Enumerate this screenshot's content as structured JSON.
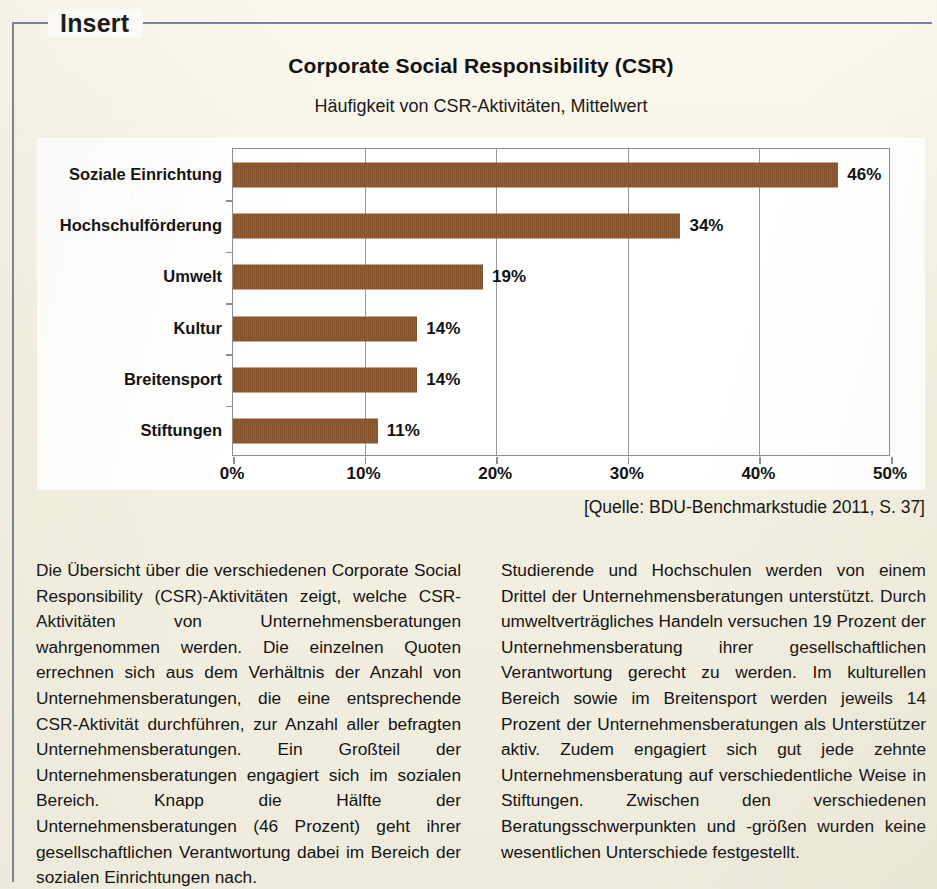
{
  "frame": {
    "legend_label": "Insert",
    "border_color": "#7a7f9f"
  },
  "chart_header": {
    "title": "Corporate Social Responsibility (CSR)",
    "subtitle": "Häufigkeit von CSR-Aktivitäten, Mittelwert"
  },
  "source": {
    "text": "[Quelle: BDU-Benchmarkstudie 2011, S. 37]"
  },
  "chart_data": {
    "type": "bar",
    "orientation": "horizontal",
    "title": "Corporate Social Responsibility (CSR)",
    "subtitle": "Häufigkeit von CSR-Aktivitäten, Mittelwert",
    "xlabel": "",
    "ylabel": "",
    "xlim": [
      0,
      50
    ],
    "grid": true,
    "legend": false,
    "bar_color": "#8a5429",
    "categories": [
      "Soziale Einrichtung",
      "Hochschulförderung",
      "Umwelt",
      "Kultur",
      "Breitensport",
      "Stiftungen"
    ],
    "values": [
      46,
      34,
      19,
      14,
      14,
      11
    ],
    "value_labels": [
      "46%",
      "34%",
      "19%",
      "14%",
      "14%",
      "11%"
    ],
    "xticks": [
      0,
      10,
      20,
      30,
      40,
      50
    ],
    "xtick_labels": [
      "0%",
      "10%",
      "20%",
      "30%",
      "40%",
      "50%"
    ]
  },
  "body": {
    "left_column": "Die Übersicht über die verschiedenen Corporate Social Responsibility (CSR)-Aktivitäten zeigt, welche CSR-Aktivitäten von Unternehmensberatungen wahrgenommen werden. Die einzelnen Quoten errechnen sich aus dem Verhältnis der Anzahl von Unternehmensberatungen, die eine entsprechende CSR-Aktivität durchführen, zur Anzahl aller befragten Unternehmensberatungen. Ein Großteil der Unternehmensberatungen engagiert sich im sozialen Bereich. Knapp die Hälfte der Unternehmensberatungen (46 Prozent) geht ihrer gesellschaftlichen Verantwortung dabei im Bereich der sozialen Einrichtungen nach.",
    "right_column": "Studierende und Hochschulen werden von einem Drittel der Unternehmensberatungen unterstützt. Durch umweltverträgliches Handeln versuchen 19 Prozent der Unternehmensberatung ihrer gesellschaftlichen Verantwortung gerecht zu werden. Im kulturellen Bereich sowie im Breitensport werden jeweils 14 Prozent der Unternehmensberatungen als Unterstützer aktiv. Zudem engagiert sich gut jede zehnte Unternehmensberatung auf verschiedentliche Weise in Stiftungen. Zwischen den verschiedenen Beratungsschwerpunkten und -größen wurden keine wesentlichen Unterschiede festgestellt."
  }
}
